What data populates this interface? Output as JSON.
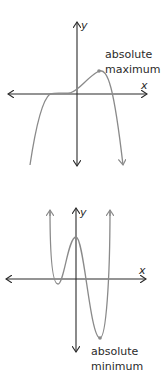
{
  "graphs": [
    {
      "id": "absolute-maximum-graph",
      "x_label": "x",
      "y_label": "y",
      "annotation_line1": "absolute",
      "annotation_line2": "maximum",
      "curve_color": "#8a8a8a",
      "axis_color": "#2b2b2b"
    },
    {
      "id": "absolute-minimum-graph",
      "x_label": "x",
      "y_label": "y",
      "annotation_line1": "absolute",
      "annotation_line2": "minimum",
      "curve_color": "#8a8a8a",
      "axis_color": "#2b2b2b"
    }
  ]
}
